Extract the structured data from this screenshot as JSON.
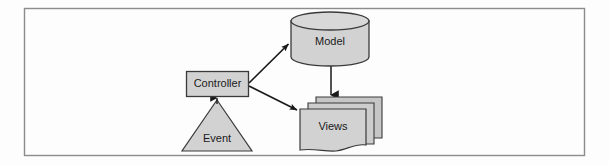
{
  "figure": {
    "kind": "mvc-architecture-diagram",
    "caption": "",
    "frame": {
      "border_color": "#8c8c8c",
      "background_color": "#fdfdfd",
      "x": 24,
      "y": 8,
      "width": 561,
      "height": 148
    },
    "style": {
      "shape_fill": "#d2d2d2",
      "shape_stroke": "#3a3a3a",
      "shadow_fill": "#bdbdbd",
      "arrow_color": "#1a1a1a",
      "label_color": "#1a1a1a"
    },
    "nodes": [
      {
        "id": "controller",
        "label": "Controller",
        "shape": "rectangle",
        "x": 186,
        "y": 71,
        "width": 62,
        "height": 26
      },
      {
        "id": "event",
        "label": "Event",
        "shape": "triangle",
        "apex_x": 217,
        "apex_y": 99,
        "base_left_x": 190,
        "base_right_x": 252,
        "base_y": 151
      },
      {
        "id": "model",
        "label": "Model",
        "shape": "cylinder",
        "x": 291,
        "y": 12,
        "width": 78,
        "height": 54,
        "ellipse_ry": 9
      },
      {
        "id": "views",
        "label": "Views",
        "shape": "document-stack",
        "x": 300,
        "y": 97,
        "width": 82,
        "height": 52,
        "stack_count": 3,
        "stack_offset": 8
      }
    ],
    "edges": [
      {
        "id": "controller-to-model",
        "from": "controller",
        "to": "model",
        "label": "",
        "style": "solid",
        "arrowhead": "filled-triangle",
        "x1": 249,
        "y1": 84,
        "x2": 288,
        "y2": 44
      },
      {
        "id": "controller-to-views",
        "from": "controller",
        "to": "views",
        "label": "",
        "style": "solid",
        "arrowhead": "filled-triangle",
        "x1": 249,
        "y1": 86,
        "x2": 296,
        "y2": 110
      },
      {
        "id": "model-to-views",
        "from": "model",
        "to": "views",
        "label": "",
        "style": "solid",
        "arrowhead": "filled-triangle",
        "x1": 331,
        "y1": 66,
        "x2": 331,
        "y2": 96
      },
      {
        "id": "event-to-controller",
        "from": "event",
        "to": "controller",
        "label": "",
        "style": "solid",
        "arrowhead": "none",
        "x1": 217,
        "y1": 99,
        "x2": 217,
        "y2": 97
      }
    ]
  }
}
